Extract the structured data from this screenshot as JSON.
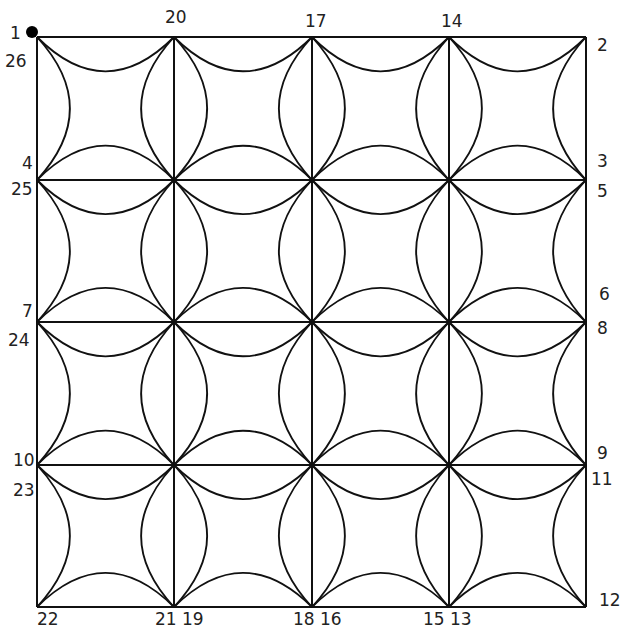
{
  "diagram": {
    "grid": {
      "cols": 4,
      "rows": 4,
      "x": [
        37,
        174,
        312,
        449,
        586
      ],
      "y": [
        37,
        180,
        322,
        465,
        607
      ]
    },
    "line_color": "#111111",
    "start_marker": {
      "label": "1",
      "x": 32,
      "y": 32
    },
    "labels": [
      {
        "text": "1",
        "x": 10,
        "y": 25
      },
      {
        "text": "26",
        "x": 5,
        "y": 53
      },
      {
        "text": "20",
        "x": 165,
        "y": 9
      },
      {
        "text": "17",
        "x": 305,
        "y": 13
      },
      {
        "text": "14",
        "x": 441,
        "y": 13
      },
      {
        "text": "2",
        "x": 597,
        "y": 37
      },
      {
        "text": "4",
        "x": 22,
        "y": 155
      },
      {
        "text": "25",
        "x": 11,
        "y": 181
      },
      {
        "text": "3",
        "x": 597,
        "y": 153
      },
      {
        "text": "5",
        "x": 597,
        "y": 183
      },
      {
        "text": "6",
        "x": 599,
        "y": 286
      },
      {
        "text": "7",
        "x": 22,
        "y": 303
      },
      {
        "text": "24",
        "x": 8,
        "y": 332
      },
      {
        "text": "8",
        "x": 597,
        "y": 320
      },
      {
        "text": "10",
        "x": 13,
        "y": 452
      },
      {
        "text": "23",
        "x": 13,
        "y": 482
      },
      {
        "text": "9",
        "x": 597,
        "y": 445
      },
      {
        "text": "11",
        "x": 591,
        "y": 471
      },
      {
        "text": "12",
        "x": 599,
        "y": 592
      },
      {
        "text": "22",
        "x": 37,
        "y": 611
      },
      {
        "text": "21 19",
        "x": 155,
        "y": 611
      },
      {
        "text": "18 16",
        "x": 293,
        "y": 611
      },
      {
        "text": "15 13",
        "x": 423,
        "y": 611
      }
    ]
  }
}
